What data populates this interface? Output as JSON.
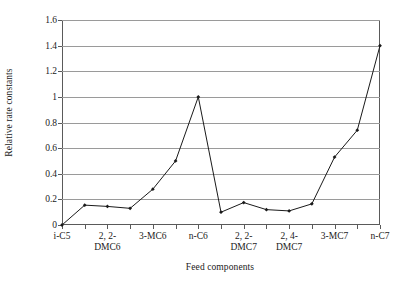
{
  "chart_data": {
    "type": "line",
    "title": "",
    "subtitle": "",
    "xlabel": "Feed components",
    "ylabel": "Relative rate constants",
    "ylim": [
      0,
      1.6
    ],
    "ytick_values": [
      0,
      0.2,
      0.4,
      0.6,
      0.8,
      1,
      1.2,
      1.4,
      1.6
    ],
    "ytick_labels": [
      "0",
      "0.2",
      "0.4",
      "0.6",
      "0.8",
      "1",
      "1.2",
      "1.4",
      "1.6"
    ],
    "grid": "horizontal",
    "legend": "none",
    "marker": "filled-diamond",
    "line_color": "#1a1a1a",
    "grid_color": "#9a9a9a",
    "axis_color": "#5a5a5a",
    "background_color": "#ffffff",
    "n_points": 15,
    "x_indices": [
      0,
      1,
      2,
      3,
      4,
      5,
      6,
      7,
      8,
      9,
      10,
      11,
      12,
      13,
      14
    ],
    "categories": [
      "i-C5",
      "",
      "2, 2-\nDMC6",
      "",
      "3-MC6",
      "",
      "n-C6",
      "",
      "2, 2-\nDMC7",
      "",
      "2, 4-\nDMC7",
      "",
      "3-MC7",
      "",
      "n-C7"
    ],
    "xtick_labels_visible": [
      {
        "index": 0,
        "label": "i-C5"
      },
      {
        "index": 2,
        "label": "2, 2-\nDMC6"
      },
      {
        "index": 4,
        "label": "3-MC6"
      },
      {
        "index": 6,
        "label": "n-C6"
      },
      {
        "index": 8,
        "label": "2, 2-\nDMC7"
      },
      {
        "index": 10,
        "label": "2, 4-\nDMC7"
      },
      {
        "index": 12,
        "label": "3-MC7"
      },
      {
        "index": 14,
        "label": "n-C7"
      }
    ],
    "values": [
      0,
      0.155,
      0.145,
      0.13,
      0.28,
      0.5,
      1.0,
      0.1,
      0.175,
      0.12,
      0.11,
      0.165,
      0.53,
      0.74,
      1.4
    ],
    "series": [
      {
        "name": "Relative rate constants",
        "values": [
          0,
          0.155,
          0.145,
          0.13,
          0.28,
          0.5,
          1.0,
          0.1,
          0.175,
          0.12,
          0.11,
          0.165,
          0.53,
          0.74,
          1.4
        ]
      }
    ]
  }
}
